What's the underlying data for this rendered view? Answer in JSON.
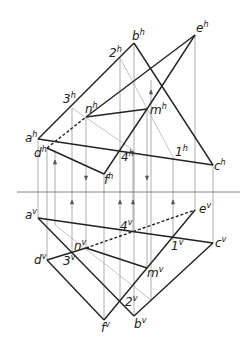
{
  "diagram": {
    "type": "descriptive-geometry-two-projections",
    "axis_y": 192,
    "colors": {
      "line": "#222222",
      "thin": "#777777",
      "aux": "#aaaaaa"
    },
    "labels_h": [
      {
        "id": "a",
        "text": "a",
        "sup": "h",
        "x": 25,
        "y": 142
      },
      {
        "id": "d",
        "text": "d",
        "sup": "h",
        "x": 34,
        "y": 157
      },
      {
        "id": "b",
        "text": "b",
        "sup": "h",
        "x": 132,
        "y": 40
      },
      {
        "id": "e",
        "text": "e",
        "sup": "h",
        "x": 196,
        "y": 32
      },
      {
        "id": "c",
        "text": "c",
        "sup": "h",
        "x": 214,
        "y": 170
      },
      {
        "id": "f",
        "text": "f",
        "sup": "h",
        "x": 104,
        "y": 184
      },
      {
        "id": "n",
        "text": "n",
        "sup": "h",
        "x": 85,
        "y": 113
      },
      {
        "id": "m",
        "text": "m",
        "sup": "h",
        "x": 150,
        "y": 114
      },
      {
        "id": "2",
        "text": "2",
        "sup": "h",
        "x": 109,
        "y": 57
      },
      {
        "id": "3",
        "text": "3",
        "sup": "h",
        "x": 63,
        "y": 103
      },
      {
        "id": "4",
        "text": "4",
        "sup": "h",
        "x": 121,
        "y": 161
      },
      {
        "id": "1",
        "text": "1",
        "sup": "h",
        "x": 175,
        "y": 156
      }
    ],
    "labels_v": [
      {
        "id": "a",
        "text": "a",
        "sup": "v",
        "x": 25,
        "y": 219
      },
      {
        "id": "d",
        "text": "d",
        "sup": "v",
        "x": 34,
        "y": 264
      },
      {
        "id": "e",
        "text": "e",
        "sup": "v",
        "x": 199,
        "y": 213
      },
      {
        "id": "c",
        "text": "c",
        "sup": "v",
        "x": 215,
        "y": 247
      },
      {
        "id": "f",
        "text": "f",
        "sup": "v",
        "x": 101,
        "y": 332
      },
      {
        "id": "b",
        "text": "b",
        "sup": "v",
        "x": 134,
        "y": 328
      },
      {
        "id": "n",
        "text": "n",
        "sup": "v",
        "x": 74,
        "y": 250
      },
      {
        "id": "m",
        "text": "m",
        "sup": "v",
        "x": 147,
        "y": 277
      },
      {
        "id": "4",
        "text": "4",
        "sup": "v",
        "x": 120,
        "y": 230
      },
      {
        "id": "1",
        "text": "1",
        "sup": "v",
        "x": 171,
        "y": 250
      },
      {
        "id": "3",
        "text": "3",
        "sup": "v",
        "x": 63,
        "y": 265
      },
      {
        "id": "2",
        "text": "2",
        "sup": "v",
        "x": 125,
        "y": 306
      }
    ]
  }
}
